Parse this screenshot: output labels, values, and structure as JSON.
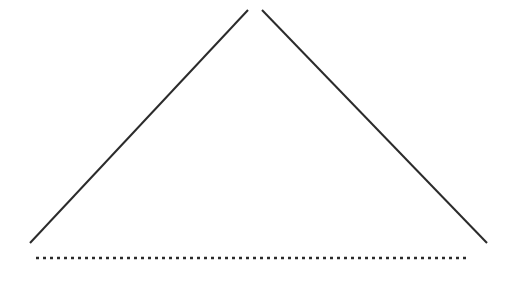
{
  "figure": {
    "canvas": {
      "width": 513,
      "height": 281,
      "background_color": "#ffffff"
    },
    "style": {
      "stroke_color": "#2b2b2b",
      "stroke_width": 2,
      "dotted_stroke_width": 2.6,
      "dash_pattern": "3 4",
      "line_cap": "butt"
    },
    "shapes": {
      "left_ray": {
        "label": "left-ray",
        "kind": "line",
        "x1": 30,
        "y1": 243,
        "x2": 248,
        "y2": 10
      },
      "right_ray": {
        "label": "right-ray",
        "kind": "line",
        "x1": 262,
        "y1": 10,
        "x2": 487,
        "y2": 243
      },
      "baseline": {
        "label": "dotted-baseline",
        "kind": "dotted-line",
        "x1": 36,
        "y1": 258,
        "x2": 470,
        "y2": 258
      }
    },
    "apex_gap": {
      "left_tip_x": 248,
      "right_tip_x": 262,
      "tip_y": 10,
      "gap_px": 14
    }
  }
}
